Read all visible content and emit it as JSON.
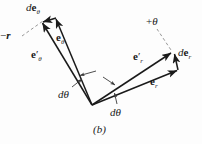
{
  "figure": {
    "caption": "(b)",
    "background_color": "#fdfdfd",
    "ink_color": "#1a1a1a",
    "width": 202,
    "height": 144
  },
  "labels": {
    "de_theta": {
      "d": "d",
      "vector": "e",
      "subscript": "θ"
    },
    "minus_r": {
      "sign": "−",
      "vector": "r"
    },
    "e_theta": {
      "vector": "e",
      "prime": "",
      "subscript": "θ"
    },
    "e_theta_prime": {
      "vector": "e",
      "prime": "′",
      "subscript": "θ"
    },
    "d_theta_left": {
      "d": "d",
      "symbol": "θ"
    },
    "d_theta_right": {
      "d": "d",
      "symbol": "θ"
    },
    "plus_theta": {
      "sign": "+",
      "symbol": "θ"
    },
    "e_r_prime": {
      "vector": "e",
      "prime": "′",
      "subscript": "r"
    },
    "de_r": {
      "d": "d",
      "vector": "e",
      "subscript": "r"
    },
    "e_r": {
      "vector": "e",
      "prime": "",
      "subscript": "r"
    }
  },
  "geometry": {
    "origin": {
      "x": 92,
      "y": 105
    },
    "vectors": [
      {
        "name": "e_theta",
        "from": [
          92,
          105
        ],
        "to": [
          55,
          18
        ]
      },
      {
        "name": "e_theta_prime",
        "from": [
          92,
          105
        ],
        "to": [
          41,
          22
        ]
      },
      {
        "name": "de_theta",
        "from": [
          55,
          18
        ],
        "to": [
          41,
          22
        ]
      },
      {
        "name": "e_r",
        "from": [
          92,
          105
        ],
        "to": [
          178,
          70
        ]
      },
      {
        "name": "e_r_prime",
        "from": [
          92,
          105
        ],
        "to": [
          172,
          52
        ]
      },
      {
        "name": "de_r",
        "from": [
          178,
          70
        ],
        "to": [
          174,
          52
        ]
      }
    ],
    "leaders": [
      {
        "name": "minus-r-leader",
        "from": [
          22,
          36
        ],
        "to": [
          44,
          21
        ],
        "style": "dashed"
      },
      {
        "name": "plus-theta-leader",
        "from": [
          158,
          30
        ],
        "to": [
          172,
          50
        ],
        "style": "dashed"
      },
      {
        "name": "d-theta-left-pointer",
        "from": [
          73,
          86
        ],
        "to": [
          84,
          78
        ],
        "style": "arrow"
      },
      {
        "name": "d-theta-left-pointer-2",
        "from": [
          95,
          72
        ],
        "to": [
          79,
          76
        ],
        "style": "arrow"
      },
      {
        "name": "d-theta-right-pointer",
        "from": [
          117,
          104
        ],
        "to": [
          114,
          92
        ],
        "style": "arrow"
      },
      {
        "name": "d-theta-right-pointer-2",
        "from": [
          104,
          78
        ],
        "to": [
          116,
          86
        ],
        "style": "arrow"
      }
    ]
  }
}
